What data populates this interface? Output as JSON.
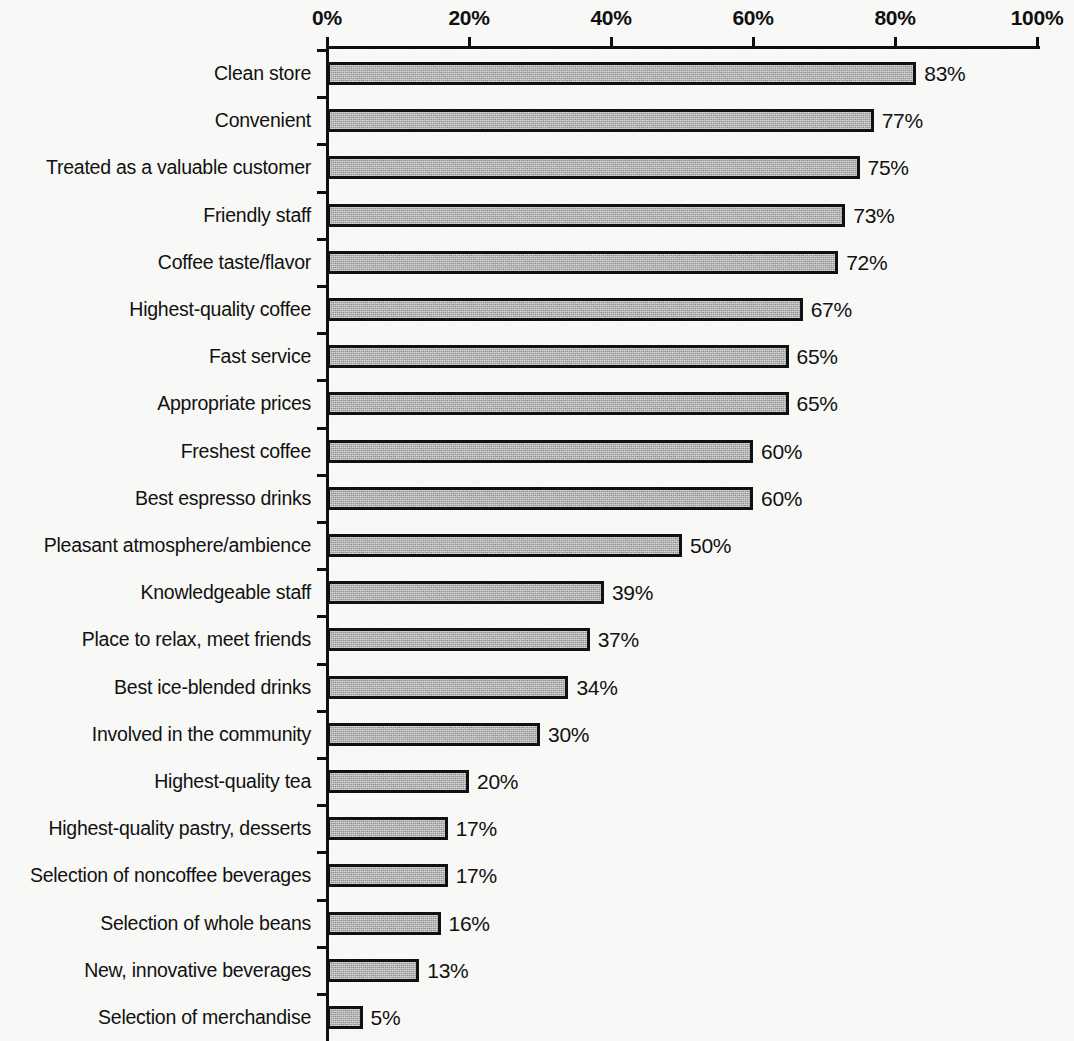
{
  "chart_data": {
    "type": "bar",
    "orientation": "horizontal",
    "title": "",
    "subtitle": "",
    "xlabel": "",
    "ylabel": "",
    "xlim": [
      0,
      100
    ],
    "grid": false,
    "legend": null,
    "value_suffix": "%",
    "axis_ticks": [
      {
        "value": 0,
        "label": "0%"
      },
      {
        "value": 20,
        "label": "20%"
      },
      {
        "value": 40,
        "label": "40%"
      },
      {
        "value": 60,
        "label": "60%"
      },
      {
        "value": 80,
        "label": "80%"
      },
      {
        "value": 100,
        "label": "100%"
      }
    ],
    "categories": [
      "Clean store",
      "Convenient",
      "Treated as a valuable customer",
      "Friendly staff",
      "Coffee taste/flavor",
      "Highest-quality coffee",
      "Fast service",
      "Appropriate prices",
      "Freshest coffee",
      "Best espresso drinks",
      "Pleasant atmosphere/ambience",
      "Knowledgeable staff",
      "Place to relax, meet friends",
      "Best ice-blended drinks",
      "Involved in the community",
      "Highest-quality tea",
      "Highest-quality pastry, desserts",
      "Selection of noncoffee beverages",
      "Selection of whole beans",
      "New, innovative beverages",
      "Selection of merchandise"
    ],
    "values": [
      83,
      77,
      75,
      73,
      72,
      67,
      65,
      65,
      60,
      60,
      50,
      39,
      37,
      34,
      30,
      20,
      17,
      17,
      16,
      13,
      5
    ],
    "data_labels": [
      "83%",
      "77%",
      "75%",
      "73%",
      "72%",
      "67%",
      "65%",
      "65%",
      "60%",
      "60%",
      "50%",
      "39%",
      "37%",
      "34%",
      "30%",
      "20%",
      "17%",
      "17%",
      "16%",
      "13%",
      "5%"
    ],
    "colors": {
      "bar_fill": "#9b9b9b",
      "bar_border": "#111111",
      "axis": "#101010",
      "text": "#111111",
      "background": "#f8f8f6"
    }
  }
}
